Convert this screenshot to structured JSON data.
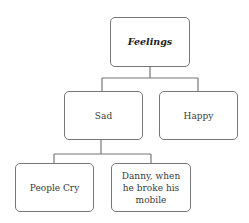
{
  "diagram": {
    "root": {
      "label": "Feelings"
    },
    "level1": [
      {
        "label": "Sad"
      },
      {
        "label": "Happy"
      }
    ],
    "level2": [
      {
        "label": "People Cry",
        "parent": "Sad"
      },
      {
        "label": "Danny, when he broke his mobile",
        "parent": "Sad"
      }
    ],
    "edges": [
      [
        "Feelings",
        "Sad"
      ],
      [
        "Feelings",
        "Happy"
      ],
      [
        "Sad",
        "People Cry"
      ],
      [
        "Sad",
        "Danny, when he broke his mobile"
      ]
    ]
  }
}
